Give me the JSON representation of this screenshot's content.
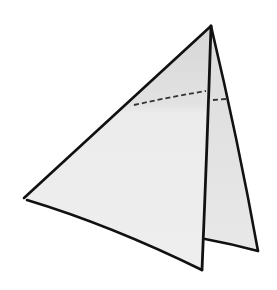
{
  "diagram": {
    "title": "",
    "colors": {
      "background": "#ffffff",
      "paper_front": "#ececec",
      "paper_top_shade": "#d9d9d9",
      "paper_back": "#e6e6e6",
      "outline": "#111111",
      "fold_line": "#333333"
    },
    "shapes": {
      "front_face": "front-triangle",
      "back_flap": "back-triangle",
      "fold_line": "dashed-fold-line"
    }
  }
}
